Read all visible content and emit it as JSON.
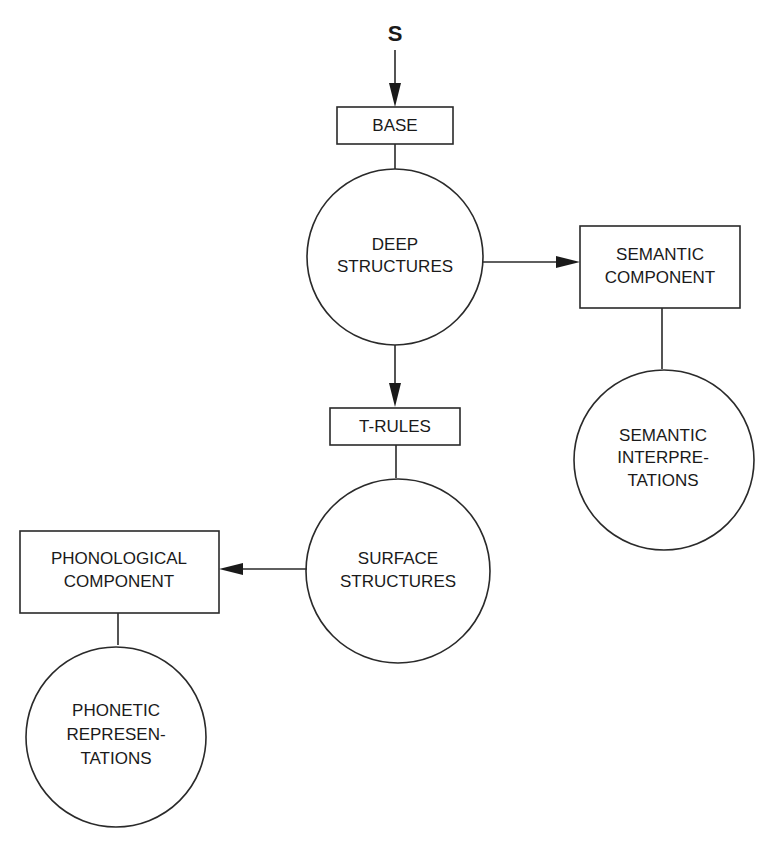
{
  "diagram": {
    "start": {
      "label": "S"
    },
    "nodes": {
      "base": {
        "shape": "rectangle",
        "lines": [
          "BASE"
        ]
      },
      "deep_structures": {
        "shape": "circle",
        "lines": [
          "DEEP",
          "STRUCTURES"
        ]
      },
      "semantic_component": {
        "shape": "rectangle",
        "lines": [
          "SEMANTIC",
          "COMPONENT"
        ]
      },
      "semantic_interpretations": {
        "shape": "circle",
        "lines": [
          "SEMANTIC",
          "INTERPRE-",
          "TATIONS"
        ]
      },
      "t_rules": {
        "shape": "rectangle",
        "lines": [
          "T-RULES"
        ]
      },
      "surface_structures": {
        "shape": "circle",
        "lines": [
          "SURFACE",
          "STRUCTURES"
        ]
      },
      "phonological_component": {
        "shape": "rectangle",
        "lines": [
          "PHONOLOGICAL",
          "COMPONENT"
        ]
      },
      "phonetic_representations": {
        "shape": "circle",
        "lines": [
          "PHONETIC",
          "REPRESEN-",
          "TATIONS"
        ]
      }
    },
    "edges": [
      {
        "from": "S",
        "to": "BASE",
        "arrow": true
      },
      {
        "from": "BASE",
        "to": "DEEP STRUCTURES",
        "arrow": false
      },
      {
        "from": "DEEP STRUCTURES",
        "to": "SEMANTIC COMPONENT",
        "arrow": true
      },
      {
        "from": "SEMANTIC COMPONENT",
        "to": "SEMANTIC INTERPRETATIONS",
        "arrow": false
      },
      {
        "from": "DEEP STRUCTURES",
        "to": "T-RULES",
        "arrow": true
      },
      {
        "from": "T-RULES",
        "to": "SURFACE STRUCTURES",
        "arrow": false
      },
      {
        "from": "SURFACE STRUCTURES",
        "to": "PHONOLOGICAL COMPONENT",
        "arrow": true
      },
      {
        "from": "PHONOLOGICAL COMPONENT",
        "to": "PHONETIC REPRESENTATIONS",
        "arrow": false
      }
    ],
    "colors": {
      "line": "#2a2a2a",
      "text": "#1a1a1a",
      "background": "#ffffff"
    }
  }
}
